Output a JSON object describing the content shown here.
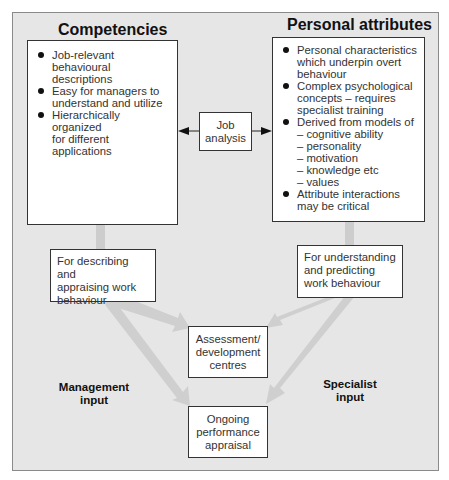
{
  "diagram": {
    "competencies": {
      "title": "Competencies",
      "bullets": [
        "Job-relevant behavioural descriptions",
        "Easy for managers to understand and utilize",
        "Hierarchically organized for different applications"
      ],
      "bullet_lines": [
        [
          "Job-relevant behavioural",
          "descriptions"
        ],
        [
          "Easy for managers to",
          "understand and utilize"
        ],
        [
          "Hierarchically organized",
          "for different applications"
        ]
      ]
    },
    "personal_attributes": {
      "title": "Personal attributes",
      "bullet_lines": [
        [
          "Personal characteristics",
          "which underpin overt",
          "behaviour"
        ],
        [
          "Complex psychological",
          "concepts – requires",
          "specialist training"
        ],
        [
          "Derived from models of",
          "– cognitive ability",
          "– personality",
          "– motivation",
          "– knowledge etc",
          "– values"
        ],
        [
          "Attribute interactions",
          "may be critical"
        ]
      ]
    },
    "job_analysis": {
      "lines": [
        "Job",
        "analysis"
      ]
    },
    "describing": {
      "lines": [
        "For describing and",
        "appraising work",
        "behaviour"
      ]
    },
    "understanding": {
      "lines": [
        "For understanding",
        "and predicting",
        "work behaviour"
      ]
    },
    "assessment": {
      "lines": [
        "Assessment/",
        "development",
        "centres"
      ]
    },
    "ongoing": {
      "lines": [
        "Ongoing",
        "performance",
        "appraisal"
      ]
    },
    "management_input": {
      "lines": [
        "Management",
        "input"
      ]
    },
    "specialist_input": {
      "lines": [
        "Specialist",
        "input"
      ]
    },
    "colors": {
      "background": "#e6e6e6",
      "arrow_fill": "#cccccc",
      "box_fill": "#ffffff",
      "border": "#333333"
    }
  }
}
